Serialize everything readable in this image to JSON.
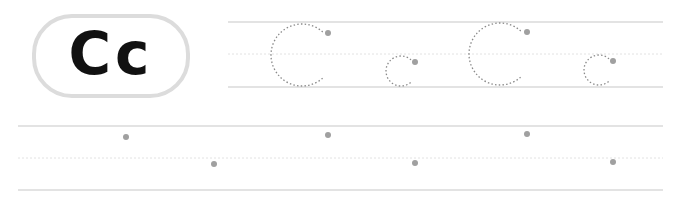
{
  "worksheet": {
    "letter_badge": {
      "text": "Cc",
      "border_color": "#dcdcdc",
      "text_color": "#111111"
    },
    "colors": {
      "line": "#c8c8c8",
      "midline": "#e2e2e2",
      "trace": "#8a8a8a",
      "dot": "#a0a0a0"
    },
    "row1": {
      "guide_lines": {
        "top_y": 22,
        "mid_y": 54,
        "bottom_y": 87,
        "x_start": 228,
        "x_end": 663
      },
      "traces": [
        {
          "letter": "C",
          "type": "uppercase",
          "cx": 302,
          "cy": 55,
          "r": 31,
          "dot": [
            328,
            33
          ]
        },
        {
          "letter": "c",
          "type": "lowercase",
          "cx": 401,
          "cy": 71,
          "r": 15,
          "dot": [
            415,
            62
          ]
        },
        {
          "letter": "C",
          "type": "uppercase",
          "cx": 500,
          "cy": 54,
          "r": 31,
          "dot": [
            527,
            32
          ]
        },
        {
          "letter": "c",
          "type": "lowercase",
          "cx": 599,
          "cy": 70,
          "r": 15,
          "dot": [
            613,
            61
          ]
        }
      ]
    },
    "row2": {
      "guide_lines": {
        "top_y": 126,
        "mid_y": 158,
        "bottom_y": 190,
        "x_start": 18,
        "x_end": 663
      },
      "start_dots": [
        [
          126,
          137
        ],
        [
          214,
          164
        ],
        [
          328,
          135
        ],
        [
          415,
          163
        ],
        [
          527,
          134
        ],
        [
          613,
          162
        ]
      ]
    }
  }
}
